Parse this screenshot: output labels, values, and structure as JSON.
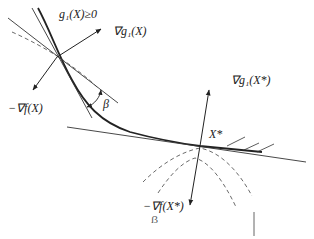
{
  "diagram": {
    "labels": {
      "constraint_region": "g₁(X)≥0",
      "grad_g_at_X": "∇g₁(X)",
      "neg_grad_f_at_X": "−∇f(X)",
      "angle": "β",
      "grad_g_at_Xstar": "∇g₁(X*)",
      "point_Xstar": "X*",
      "neg_grad_f_at_Xstar": "−∇f(X*)",
      "stray_mark": "ẞ"
    },
    "colors": {
      "stroke": "#222222",
      "dashed": "#444444",
      "background": "#ffffff"
    },
    "points": {
      "X": [
        57,
        57
      ],
      "X_star": [
        200,
        146
      ]
    }
  }
}
